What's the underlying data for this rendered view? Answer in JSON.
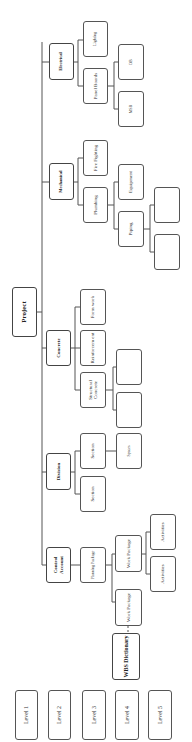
{
  "diagram": {
    "root": "Project",
    "levels": [
      "Level 1",
      "Level 2",
      "Level 3",
      "Level 4",
      "Level 5"
    ],
    "wbs_dictionary": "WBS Dictionary",
    "branches": {
      "control_account": {
        "label": "Control Account",
        "planning_package": "Planning Package",
        "work_package_1": "Work Package",
        "work_package_2": "Work Package",
        "activities_1": "Activities",
        "activities_2": "Activities"
      },
      "division": {
        "label": "Division",
        "section_1": "Section",
        "section_2": "Section",
        "space": "Spaces"
      },
      "concrete": {
        "label": "Concrete",
        "structural_concrete": "Structural Concrete",
        "reinforcement": "Reinforcem ent",
        "formwork": "Form work",
        "empty_1": "",
        "empty_2": ""
      },
      "mechanical": {
        "label": "Mechanical",
        "plumbing": "Plumbing",
        "fire_fighting": "Fire Fighting",
        "piping": "Piping",
        "equipment": "Equipment",
        "empty_1": "",
        "empty_2": ""
      },
      "electrical": {
        "label": "Electrical",
        "panel_boards": "Panel Boards",
        "lighting": "Lighting",
        "msb": "MSB",
        "db": "DB"
      }
    }
  }
}
